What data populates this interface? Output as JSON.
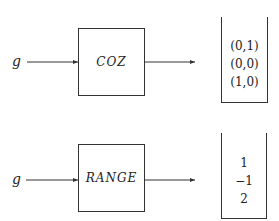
{
  "diagrams": [
    {
      "input_label": "g",
      "function_label": "COZ",
      "output_stack": [
        "(0,1)",
        "(0,0)",
        "(1,0)"
      ]
    },
    {
      "input_label": "g",
      "function_label": "RANGE",
      "output_stack": [
        "1",
        "−1",
        "2"
      ]
    }
  ],
  "colors": {
    "stroke": "#333333",
    "text": "#222222",
    "background": "#ffffff"
  }
}
